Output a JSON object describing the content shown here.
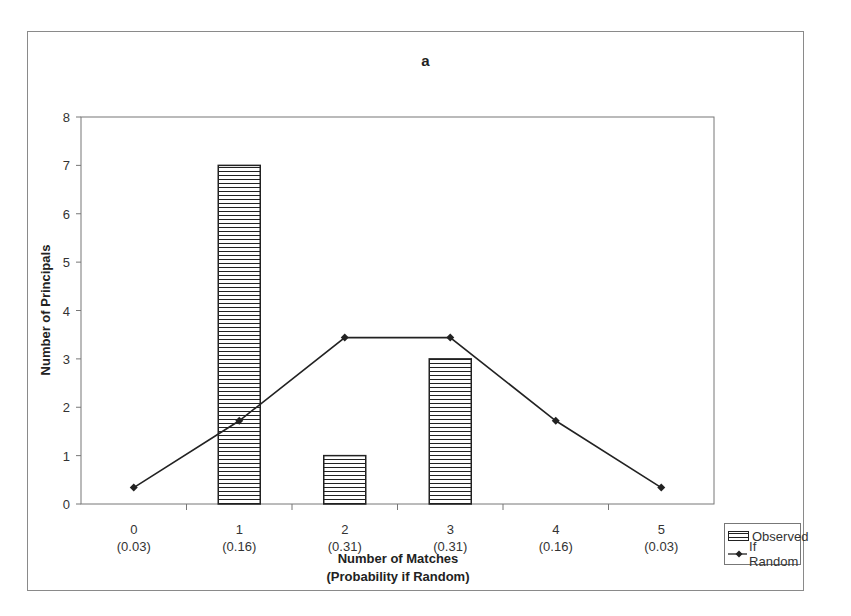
{
  "chart_data": {
    "type": "bar",
    "title": "a",
    "xlabel": "Number of Matches\n(Probability if Random)",
    "xlabel_lines": [
      "Number of Matches",
      "(Probability if Random)"
    ],
    "ylabel": "Number of Principals",
    "ylim": [
      0,
      8
    ],
    "yticks": [
      0,
      1,
      2,
      3,
      4,
      5,
      6,
      7,
      8
    ],
    "categories": [
      "0",
      "1",
      "2",
      "3",
      "4",
      "5"
    ],
    "category_probabilities": [
      "(0.03)",
      "(0.16)",
      "(0.31)",
      "(0.31)",
      "(0.16)",
      "(0.03)"
    ],
    "series": [
      {
        "name": "Observed",
        "type": "bar",
        "pattern": "horizontal-lines",
        "values": [
          0,
          7,
          1,
          3,
          0,
          0
        ]
      },
      {
        "name": "If Random",
        "type": "line",
        "marker": "diamond",
        "values": [
          0.34,
          1.72,
          3.44,
          3.44,
          1.72,
          0.34
        ]
      }
    ],
    "grid": false,
    "legend_position": "right-bottom"
  },
  "legend": {
    "items": [
      {
        "label": "Observed"
      },
      {
        "label": "If Random"
      }
    ]
  },
  "colors": {
    "bar_stroke": "#222222",
    "line": "#222222",
    "axis": "#777777"
  }
}
